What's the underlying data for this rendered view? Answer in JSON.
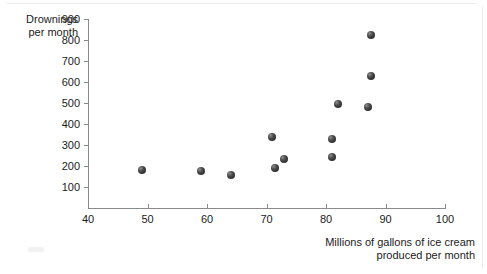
{
  "chart_data": {
    "type": "scatter",
    "title": "",
    "xlabel": "Millions of gallons of ice cream produced per month",
    "ylabel": "Drownings per month",
    "xlabel_line1": "Millions of gallons of ice cream",
    "xlabel_line2": "produced per month",
    "ylabel_line1": "Drownings",
    "ylabel_line2": "per month",
    "xlim": [
      40,
      100
    ],
    "ylim": [
      0,
      900
    ],
    "xticks": [
      40,
      50,
      60,
      70,
      80,
      90,
      100
    ],
    "yticks": [
      100,
      200,
      300,
      400,
      500,
      600,
      700,
      800,
      900
    ],
    "grid": false,
    "legend": false,
    "marker_color": "#303030",
    "axis_color": "#8a8a8a",
    "points": [
      {
        "x": 49,
        "y": 180
      },
      {
        "x": 59,
        "y": 175
      },
      {
        "x": 64,
        "y": 155
      },
      {
        "x": 71,
        "y": 340
      },
      {
        "x": 71.5,
        "y": 190
      },
      {
        "x": 73,
        "y": 235
      },
      {
        "x": 81,
        "y": 330
      },
      {
        "x": 81,
        "y": 245
      },
      {
        "x": 82,
        "y": 495
      },
      {
        "x": 87,
        "y": 480
      },
      {
        "x": 87.5,
        "y": 630
      },
      {
        "x": 87.5,
        "y": 825
      }
    ]
  },
  "geometry": {
    "x_origin_px": 88,
    "x_scale_px_per_unit": 5.95,
    "y_origin_px": 208,
    "y_scale_px_per_unit": 0.21
  }
}
